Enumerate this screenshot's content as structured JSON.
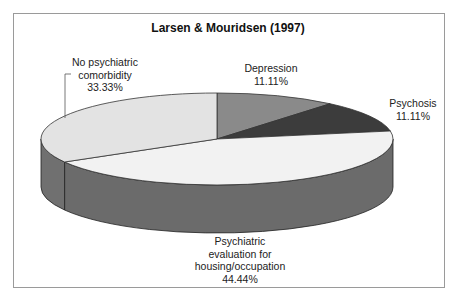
{
  "chart_data": {
    "type": "pie",
    "style": "3d",
    "title": "Larsen & Mouridsen (1997)",
    "categories": [
      "Depression",
      "Psychosis",
      "Psychiatric evaluation for housing/occupation",
      "No psychiatric comorbidity"
    ],
    "values": [
      11.11,
      11.11,
      44.44,
      33.33
    ],
    "units": "%",
    "legend": "none (data labels on slices)",
    "labels": [
      {
        "lines": [
          "Depression",
          "11.11%"
        ]
      },
      {
        "lines": [
          "Psychosis",
          "11.11%"
        ]
      },
      {
        "lines": [
          "Psychiatric",
          "evaluation for",
          "housing/occupation",
          "44.44%"
        ]
      },
      {
        "lines": [
          "No psychiatric",
          "comorbidity",
          "33.33%"
        ]
      }
    ],
    "colors": {
      "Depression": "#8a8a8a",
      "Psychosis": "#3c3c3c",
      "Psychiatric evaluation for housing/occupation": "#f2f2f2",
      "No psychiatric comorbidity": "#e3e3e3"
    }
  }
}
